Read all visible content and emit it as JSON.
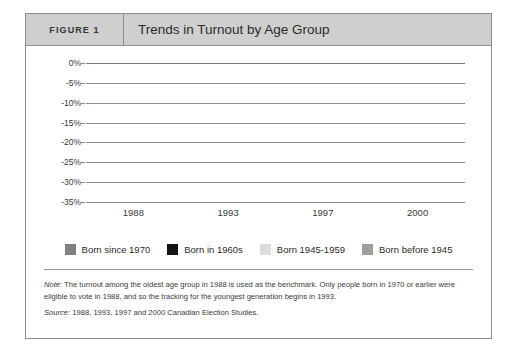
{
  "header": {
    "figure_number": "FIGURE 1",
    "title": "Trends in Turnout by Age Group"
  },
  "chart_data": {
    "type": "bar",
    "title": "Trends in Turnout by Age Group",
    "xlabel": "",
    "ylabel": "",
    "categories": [
      "1988",
      "1993",
      "1997",
      "2000"
    ],
    "ylim": [
      -35,
      0
    ],
    "yticks": [
      0,
      -5,
      -10,
      -15,
      -20,
      -25,
      -30,
      -35
    ],
    "ytick_labels": [
      "0%",
      "-5%",
      "-10%",
      "-15%",
      "-20%",
      "-25%",
      "-30%",
      "-35%"
    ],
    "grid": true,
    "legend_position": "bottom",
    "series": [
      {
        "name": "Born before 1945",
        "color": "#9e9e9e",
        "order": 0,
        "values": [
          0,
          -1.8,
          -5.0,
          -4.2
        ]
      },
      {
        "name": "Born 1945-1959",
        "color": "#dcdcdc",
        "order": 1,
        "values": [
          -5.2,
          -5.2,
          -6.8,
          -6.4
        ]
      },
      {
        "name": "Born in 1960s",
        "color": "#141414",
        "order": 2,
        "values": [
          -17.0,
          -16.2,
          -17.2,
          -17.0
        ]
      },
      {
        "name": "Born since 1970",
        "color": "#808080",
        "order": 3,
        "values": [
          null,
          -19.2,
          -28.2,
          -32.2
        ]
      }
    ],
    "legend_order": [
      "Born since 1970",
      "Born in 1960s",
      "Born 1945-1959",
      "Born before 1945"
    ]
  },
  "legend": [
    {
      "label": "Born since 1970",
      "color": "#808080"
    },
    {
      "label": "Born in 1960s",
      "color": "#141414"
    },
    {
      "label": "Born 1945-1959",
      "color": "#dcdcdc"
    },
    {
      "label": "Born before 1945",
      "color": "#9e9e9e"
    }
  ],
  "notes": {
    "note_lead": "Note:",
    "note_text": " The turnout among the oldest age group in 1988 is used as the benchmark. Only people born in 1970 or earlier were eligible to vote in 1988, and so the tracking for the youngest generation begins in 1993.",
    "source_lead": "Source:",
    "source_text": " 1988, 1993, 1997 and 2000 Canadian Election Studies."
  }
}
